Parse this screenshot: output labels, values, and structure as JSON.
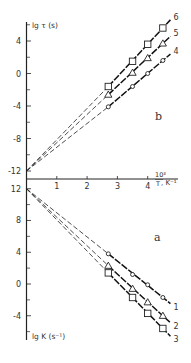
{
  "chart_data": [
    {
      "panel": "b",
      "type": "line",
      "ylabel": "lg τ (s)",
      "xlabel": "10³/T, K⁻¹",
      "xlim": [
        0,
        4.9
      ],
      "ylim": [
        -12,
        6.5
      ],
      "xticks": [
        1,
        2,
        3,
        4
      ],
      "yticks": [
        4,
        0,
        -4,
        -8,
        -12
      ],
      "grid": false,
      "intercept": {
        "x": 0,
        "y": -12
      },
      "series": [
        {
          "name": "6",
          "marker": "square",
          "x": [
            2.7,
            3.5,
            4.0,
            4.5
          ],
          "y": [
            -1.6,
            1.5,
            3.6,
            5.6
          ]
        },
        {
          "name": "5",
          "marker": "triangle",
          "x": [
            2.7,
            3.5,
            4.0,
            4.5
          ],
          "y": [
            -2.6,
            0.1,
            1.9,
            3.7
          ]
        },
        {
          "name": "4",
          "marker": "circle",
          "x": [
            2.7,
            3.5,
            4.0,
            4.5
          ],
          "y": [
            -4.1,
            -1.6,
            0.0,
            1.6
          ]
        }
      ]
    },
    {
      "panel": "a",
      "type": "line",
      "ylabel": "lg K (s⁻¹)",
      "xlabel": "10³/T, K⁻¹",
      "xlim": [
        0,
        4.9
      ],
      "ylim": [
        -6.5,
        12
      ],
      "xticks": [
        1,
        2,
        3,
        4
      ],
      "yticks": [
        12,
        8,
        4,
        0,
        -4
      ],
      "grid": false,
      "intercept": {
        "x": 0,
        "y": 12
      },
      "series": [
        {
          "name": "1",
          "marker": "circle",
          "x": [
            2.7,
            3.5,
            4.0,
            4.5
          ],
          "y": [
            3.8,
            1.2,
            -0.1,
            -1.7
          ]
        },
        {
          "name": "2",
          "marker": "triangle",
          "x": [
            2.7,
            3.5,
            4.0,
            4.5
          ],
          "y": [
            2.3,
            -0.6,
            -2.3,
            -4.0
          ]
        },
        {
          "name": "3",
          "marker": "square",
          "x": [
            2.7,
            3.5,
            4.0,
            4.5
          ],
          "y": [
            1.4,
            -1.7,
            -3.7,
            -5.6
          ]
        }
      ]
    }
  ],
  "labels": {
    "top_ylabel": "lg τ (s)",
    "bottom_ylabel": "lg K (s⁻¹)",
    "x_label_num": "10³",
    "x_label_den": "T",
    "x_label_unit": ", K⁻¹",
    "panel_b": "b",
    "panel_a": "a",
    "x_ticks": [
      "1",
      "2",
      "3",
      "4"
    ],
    "top_y_ticks": [
      "4",
      "0",
      "-4",
      "-8",
      "-12"
    ],
    "bottom_y_ticks": [
      "12",
      "8",
      "4",
      "0",
      "-4"
    ],
    "series_top": [
      "6",
      "5",
      "4"
    ],
    "series_bottom": [
      "1",
      "2",
      "3"
    ]
  }
}
